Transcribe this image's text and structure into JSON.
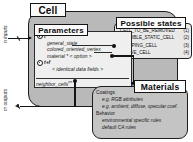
{
  "diagram": {
    "title": "Cell",
    "cell_label": "Cell",
    "materials_label": "Materials",
    "parameters": {
      "title": "Parameters",
      "groups": [
        {
          "header": "t",
          "header_icon": "circle-bullet-icon",
          "rows": [
            "general_state",
            "colored_oriented_vertex",
            "material * < option >"
          ]
        },
        {
          "header": "t+f",
          "header_icon": "circle-bullet-icon",
          "rows": [
            "< identical data fields >"
          ]
        }
      ],
      "neighbor_field": "neighbor_cells",
      "neighbor_superscript": "nn"
    },
    "possible_states": {
      "title": "Possible states",
      "items": [
        {
          "name": "CELL_TO_BE_REMOVED",
          "index": "(1)"
        },
        {
          "name": "INVISIBLE_STATIC_CELL",
          "index": "(2)"
        },
        {
          "name": "SLEEPING_CELL",
          "index": "(3)"
        },
        {
          "name": "ACTIVE_CELL",
          "index": "(4)"
        }
      ]
    },
    "materials": {
      "title": "Materials",
      "sections": [
        {
          "heading": "Coatings",
          "items": [
            "e.g. RGB attributes",
            "e.g. ambient, diffuse, specular coef."
          ]
        },
        {
          "heading": "Behavior",
          "items": [
            "environmental specific rules",
            "default CA rules"
          ]
        }
      ]
    },
    "io": {
      "input_label": "n inputs",
      "output_label": "m outputs"
    },
    "colors": {
      "cell_fill": "#b9b9b9",
      "params_fill": "#efefef",
      "states_fill": "#e9e9e9",
      "materials_fill": "#c4c4c4",
      "stroke": "#141414"
    }
  }
}
